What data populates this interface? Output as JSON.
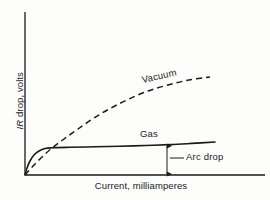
{
  "figure": {
    "background_color": "#fdfdfc",
    "ink_color": "#1a1a1a"
  },
  "axes": {
    "y_label_prefix": "IR",
    "y_label_rest": " drop, volts",
    "y_label_full": "IR drop, volts",
    "x_label": "Current, milliamperes",
    "x_axis_name": "x-axis-line",
    "y_axis_name": "y-axis-line",
    "origin_px": [
      25,
      175
    ],
    "x_axis_end_px": [
      265,
      175
    ],
    "y_axis_top_px": [
      25,
      12
    ]
  },
  "annotations": {
    "vacuum": "Vacuum",
    "gas": "Gas",
    "arc_drop": "Arc drop"
  },
  "chart_data": {
    "type": "line",
    "title": "",
    "xlabel": "Current, milliamperes",
    "ylabel": "IR drop, volts",
    "grid": false,
    "legend": "inline-annotations",
    "axis_ticks": "none",
    "xlim": [
      0,
      1
    ],
    "ylim": [
      0,
      1
    ],
    "series": [
      {
        "name": "Vacuum",
        "style": "dashed",
        "color": "#1a1a1a",
        "label_position": "above-curve-midright",
        "points_px": [
          [
            25,
            175
          ],
          [
            33,
            166
          ],
          [
            42,
            157
          ],
          [
            52,
            148
          ],
          [
            64,
            139
          ],
          [
            78,
            129
          ],
          [
            94,
            118
          ],
          [
            111,
            108
          ],
          [
            129,
            99
          ],
          [
            148,
            91
          ],
          [
            168,
            85
          ],
          [
            189,
            80
          ],
          [
            210,
            77
          ]
        ]
      },
      {
        "name": "Gas",
        "style": "solid",
        "color": "#1a1a1a",
        "label_position": "above-curve-right",
        "points_px": [
          [
            25,
            175
          ],
          [
            27,
            168
          ],
          [
            30,
            161
          ],
          [
            34,
            155
          ],
          [
            39,
            151
          ],
          [
            45,
            148.5
          ],
          [
            52,
            147.8
          ],
          [
            70,
            147.3
          ],
          [
            95,
            146.8
          ],
          [
            120,
            146.2
          ],
          [
            145,
            145.5
          ],
          [
            170,
            144.6
          ],
          [
            192,
            143.4
          ],
          [
            215,
            142.0
          ]
        ]
      }
    ],
    "measurement": {
      "name": "Arc drop",
      "type": "vertical-double-arrow",
      "x_px": 167,
      "y_top_px": 145,
      "y_bottom_px": 175,
      "leader_from_px": [
        170,
        158
      ],
      "leader_to_px": [
        184,
        158
      ]
    }
  }
}
